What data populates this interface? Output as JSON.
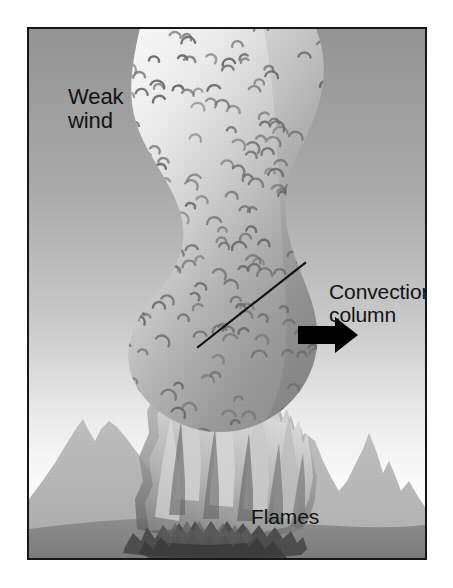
{
  "figure": {
    "frame": {
      "border_color": "#15171a",
      "border_width_px": 2
    }
  },
  "labels": {
    "weak_wind": "Weak\nwind",
    "convection_column": "Convection\ncolumn",
    "flames": "Flames"
  },
  "annotations": {
    "leader_line": {
      "name": "convection-column-leader-line",
      "from_x": 196,
      "from_y": 345,
      "to_x": 303,
      "to_y": 261,
      "color": "#111315",
      "width_px": 2
    },
    "wind_arrow": {
      "name": "wind-direction-arrow",
      "direction": "right",
      "color": "#000000",
      "x": 296,
      "y": 331,
      "width": 60,
      "height": 30
    }
  },
  "scene": {
    "sky": {
      "top_color": "#9a9a9a",
      "mid_color": "#c8c8c8",
      "horizon_color": "#fbfbfb"
    },
    "mountains": {
      "far_color": "#b9b9b9",
      "near_color": "#b3b3b3"
    },
    "ground": {
      "color": "#8f8f8f",
      "shade_color": "#7e7e7e"
    },
    "column": {
      "top_color": "#f2f2f2",
      "mid_color": "#c3c3c3",
      "base_color": "#8d8d8d",
      "eddy_mark_color": "#6e6e6e",
      "eddy_mark_count": 196
    },
    "flames": {
      "light_color": "#dcdcdc",
      "mid_color": "#a8a8a8",
      "dark_color": "#6d6d6d",
      "fuel_color": "#4a4a4a"
    }
  },
  "chart_data": {
    "type": "diagram",
    "title": "Weak wind convection column",
    "elements": [
      {
        "name": "convection column",
        "label": "Convection column",
        "description": "vertical S-curved smoke plume rising from fire"
      },
      {
        "name": "flames",
        "label": "Flames",
        "description": "jagged flame front at base of column"
      },
      {
        "name": "wind",
        "label": "Weak wind",
        "description": "light horizontal wind indicated by right-pointing arrow"
      }
    ]
  }
}
